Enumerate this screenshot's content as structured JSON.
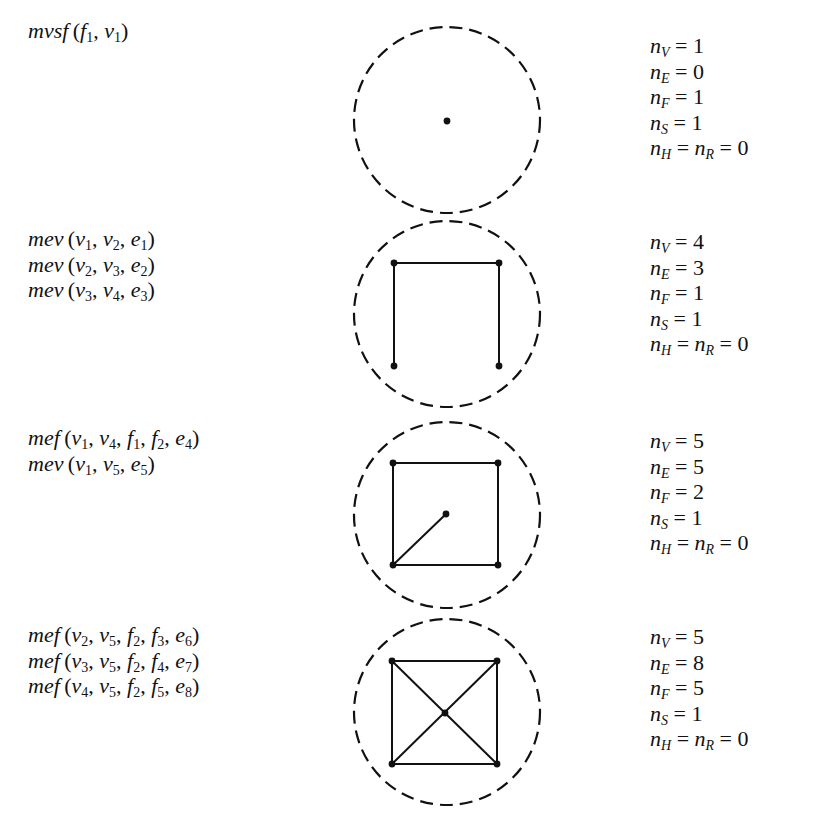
{
  "steps": [
    {
      "operations": [
        {
          "name": "mvsf",
          "args": [
            [
              "f",
              "1"
            ],
            [
              "v",
              "1"
            ]
          ]
        }
      ],
      "counts": {
        "nV": "1",
        "nE": "0",
        "nF": "1",
        "nS": "1",
        "nH_nR": "0"
      },
      "figure": {
        "circle": {
          "cx": 447,
          "cy": 120,
          "r": 93
        },
        "vertices": [
          [
            447,
            121
          ]
        ],
        "edges": []
      }
    },
    {
      "operations": [
        {
          "name": "mev",
          "args": [
            [
              "v",
              "1"
            ],
            [
              "v",
              "2"
            ],
            [
              "e",
              "1"
            ]
          ]
        },
        {
          "name": "mev",
          "args": [
            [
              "v",
              "2"
            ],
            [
              "v",
              "3"
            ],
            [
              "e",
              "2"
            ]
          ]
        },
        {
          "name": "mev",
          "args": [
            [
              "v",
              "3"
            ],
            [
              "v",
              "4"
            ],
            [
              "e",
              "3"
            ]
          ]
        }
      ],
      "counts": {
        "nV": "4",
        "nE": "3",
        "nF": "1",
        "nS": "1",
        "nH_nR": "0"
      },
      "figure": {
        "circle": {
          "cx": 447,
          "cy": 314,
          "r": 93
        },
        "vertices": [
          [
            394,
            263
          ],
          [
            499,
            263
          ],
          [
            394,
            366
          ],
          [
            499,
            366
          ]
        ],
        "edges": [
          [
            [
              394,
              366
            ],
            [
              394,
              263
            ]
          ],
          [
            [
              394,
              263
            ],
            [
              499,
              263
            ]
          ],
          [
            [
              499,
              263
            ],
            [
              499,
              366
            ]
          ]
        ]
      }
    },
    {
      "operations": [
        {
          "name": "mef",
          "args": [
            [
              "v",
              "1"
            ],
            [
              "v",
              "4"
            ],
            [
              "f",
              "1"
            ],
            [
              "f",
              "2"
            ],
            [
              "e",
              "4"
            ]
          ]
        },
        {
          "name": "mev",
          "args": [
            [
              "v",
              "1"
            ],
            [
              "v",
              "5"
            ],
            [
              "e",
              "5"
            ]
          ]
        }
      ],
      "counts": {
        "nV": "5",
        "nE": "5",
        "nF": "2",
        "nS": "1",
        "nH_nR": "0"
      },
      "figure": {
        "circle": {
          "cx": 447,
          "cy": 515,
          "r": 93
        },
        "vertices": [
          [
            393,
            463
          ],
          [
            498,
            463
          ],
          [
            393,
            565
          ],
          [
            498,
            565
          ],
          [
            446,
            514
          ]
        ],
        "edges": [
          [
            [
              393,
              565
            ],
            [
              393,
              463
            ]
          ],
          [
            [
              393,
              463
            ],
            [
              498,
              463
            ]
          ],
          [
            [
              498,
              463
            ],
            [
              498,
              565
            ]
          ],
          [
            [
              498,
              565
            ],
            [
              393,
              565
            ]
          ],
          [
            [
              393,
              565
            ],
            [
              446,
              514
            ]
          ]
        ]
      }
    },
    {
      "operations": [
        {
          "name": "mef",
          "args": [
            [
              "v",
              "2"
            ],
            [
              "v",
              "5"
            ],
            [
              "f",
              "2"
            ],
            [
              "f",
              "3"
            ],
            [
              "e",
              "6"
            ]
          ]
        },
        {
          "name": "mef",
          "args": [
            [
              "v",
              "3"
            ],
            [
              "v",
              "5"
            ],
            [
              "f",
              "2"
            ],
            [
              "f",
              "4"
            ],
            [
              "e",
              "7"
            ]
          ]
        },
        {
          "name": "mef",
          "args": [
            [
              "v",
              "4"
            ],
            [
              "v",
              "5"
            ],
            [
              "f",
              "2"
            ],
            [
              "f",
              "5"
            ],
            [
              "e",
              "8"
            ]
          ]
        }
      ],
      "counts": {
        "nV": "5",
        "nE": "8",
        "nF": "5",
        "nS": "1",
        "nH_nR": "0"
      },
      "figure": {
        "circle": {
          "cx": 447,
          "cy": 712,
          "r": 93
        },
        "vertices": [
          [
            392,
            661
          ],
          [
            497,
            661
          ],
          [
            392,
            764
          ],
          [
            497,
            764
          ],
          [
            445,
            713
          ]
        ],
        "edges": [
          [
            [
              392,
              764
            ],
            [
              392,
              661
            ]
          ],
          [
            [
              392,
              661
            ],
            [
              497,
              661
            ]
          ],
          [
            [
              497,
              661
            ],
            [
              497,
              764
            ]
          ],
          [
            [
              497,
              764
            ],
            [
              392,
              764
            ]
          ],
          [
            [
              392,
              764
            ],
            [
              497,
              661
            ]
          ],
          [
            [
              392,
              661
            ],
            [
              497,
              764
            ]
          ]
        ]
      }
    }
  ],
  "labels": {
    "nV": "n",
    "nV_sub": "V",
    "nE": "n",
    "nE_sub": "E",
    "nF": "n",
    "nF_sub": "F",
    "nS": "n",
    "nS_sub": "S",
    "nH": "n",
    "nH_sub": "H",
    "nR": "n",
    "nR_sub": "R",
    "equals": " = "
  }
}
